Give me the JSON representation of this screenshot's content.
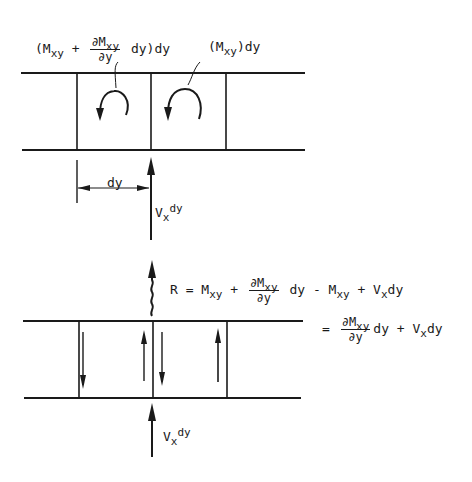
{
  "top_diagram": {
    "label_left": {
      "open": "(M",
      "sub": "xy",
      "plus": "+",
      "frac_num_prefix": "∂M",
      "frac_num_sub": "xy",
      "frac_den": "∂y",
      "tail": "dy)dy"
    },
    "label_right": {
      "open": "(M",
      "sub": "xy",
      "tail": ")dy"
    },
    "dim_label": "dy",
    "force_label": {
      "main": "V",
      "sub": "x",
      "tail": "dy"
    }
  },
  "bottom_diagram": {
    "eq1": {
      "lhs": "R = M",
      "sub1": "xy",
      "plus": "+",
      "frac_num_prefix": "∂M",
      "frac_num_sub": "xy",
      "frac_den": "∂y",
      "mid": "dy - M",
      "sub2": "xy",
      "plus2": "+ V",
      "sub3": "x",
      "tail": "dy"
    },
    "eq2": {
      "eq": "=",
      "frac_num_prefix": "∂M",
      "frac_num_sub": "xy",
      "frac_den": "∂y",
      "mid": "dy + V",
      "sub": "x",
      "tail": "dy"
    },
    "force_label": {
      "main": "V",
      "sub": "x",
      "tail": "dy"
    }
  },
  "colors": {
    "ink": "#1a1a1a",
    "background": "#ffffff"
  }
}
